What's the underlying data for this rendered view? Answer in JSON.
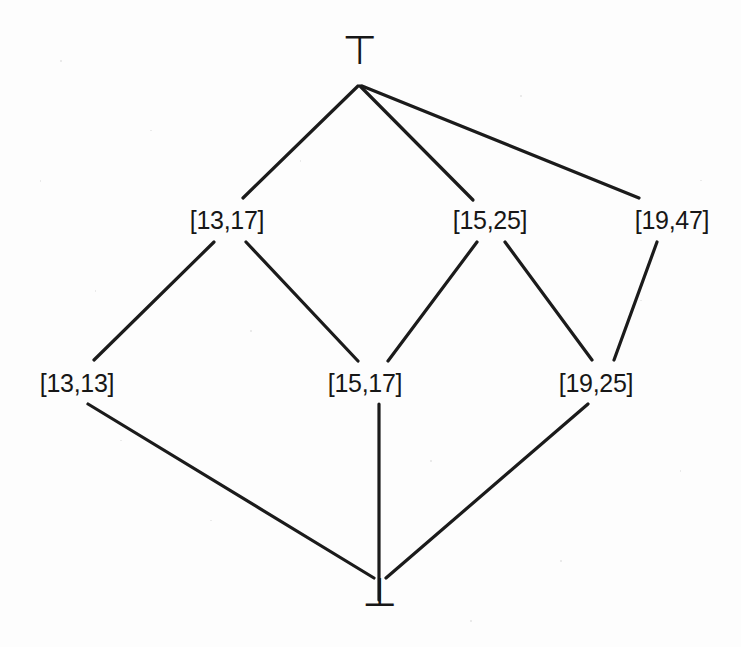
{
  "diagram": {
    "type": "hasse-lattice",
    "background_color": "#fdfdfd",
    "edge_color": "#1b1b1b",
    "text_color": "#171717",
    "edge_width": 3.2,
    "canvas": {
      "width": 741,
      "height": 647
    },
    "nodes": [
      {
        "id": "top",
        "label": "⊤",
        "kind": "symbol",
        "x": 360,
        "y": 50,
        "level": 0
      },
      {
        "id": "n1317",
        "label": "[13,17]",
        "kind": "interval",
        "x": 227,
        "y": 220,
        "level": 1
      },
      {
        "id": "n1525",
        "label": "[15,25]",
        "kind": "interval",
        "x": 490,
        "y": 220,
        "level": 1
      },
      {
        "id": "n1947",
        "label": "[19,47]",
        "kind": "interval",
        "x": 672,
        "y": 220,
        "level": 1
      },
      {
        "id": "n1313",
        "label": "[13,13]",
        "kind": "interval",
        "x": 77,
        "y": 383,
        "level": 2
      },
      {
        "id": "n1517",
        "label": "[15,17]",
        "kind": "interval",
        "x": 365,
        "y": 383,
        "level": 2
      },
      {
        "id": "n1925",
        "label": "[19,25]",
        "kind": "interval",
        "x": 596,
        "y": 383,
        "level": 2
      },
      {
        "id": "bot",
        "label": "⊥",
        "kind": "symbol",
        "x": 380,
        "y": 592,
        "level": 3
      }
    ],
    "edges": [
      {
        "id": "e-top-1317",
        "from": "top",
        "to": "n1317",
        "x1": 358,
        "y1": 86,
        "x2": 243,
        "y2": 198
      },
      {
        "id": "e-top-1525",
        "from": "top",
        "to": "n1525",
        "x1": 360,
        "y1": 86,
        "x2": 473,
        "y2": 200
      },
      {
        "id": "e-top-1947",
        "from": "top",
        "to": "n1947",
        "x1": 362,
        "y1": 86,
        "x2": 639,
        "y2": 198
      },
      {
        "id": "e-1317-1313",
        "from": "n1317",
        "to": "n1313",
        "x1": 214,
        "y1": 242,
        "x2": 94,
        "y2": 360
      },
      {
        "id": "e-1317-1517",
        "from": "n1317",
        "to": "n1517",
        "x1": 246,
        "y1": 242,
        "x2": 358,
        "y2": 361
      },
      {
        "id": "e-1525-1517",
        "from": "n1525",
        "to": "n1517",
        "x1": 477,
        "y1": 242,
        "x2": 388,
        "y2": 361
      },
      {
        "id": "e-1525-1925",
        "from": "n1525",
        "to": "n1925",
        "x1": 505,
        "y1": 242,
        "x2": 592,
        "y2": 360
      },
      {
        "id": "e-1947-1925",
        "from": "n1947",
        "to": "n1925",
        "x1": 657,
        "y1": 242,
        "x2": 614,
        "y2": 360
      },
      {
        "id": "e-1313-bot",
        "from": "n1313",
        "to": "bot",
        "x1": 88,
        "y1": 404,
        "x2": 374,
        "y2": 578
      },
      {
        "id": "e-1517-bot",
        "from": "n1517",
        "to": "bot",
        "x1": 379,
        "y1": 404,
        "x2": 379,
        "y2": 600
      },
      {
        "id": "e-1925-bot",
        "from": "n1925",
        "to": "bot",
        "x1": 588,
        "y1": 404,
        "x2": 386,
        "y2": 578
      }
    ]
  }
}
